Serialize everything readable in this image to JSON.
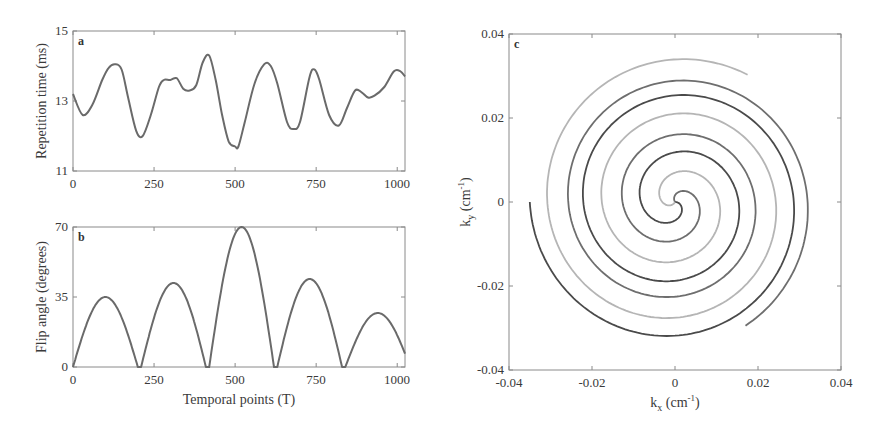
{
  "chart_data": [
    {
      "panel": "a",
      "type": "line",
      "title": "",
      "xlabel": "",
      "ylabel": "Repetition time (ms)",
      "xlim": [
        0,
        1024
      ],
      "ylim": [
        11,
        15
      ],
      "xticks": [
        0,
        250,
        500,
        750,
        1000
      ],
      "yticks": [
        11,
        13,
        15
      ],
      "grid": false,
      "series": [
        {
          "name": "TR",
          "x": [
            0,
            30,
            60,
            90,
            110,
            130,
            150,
            170,
            195,
            215,
            240,
            265,
            280,
            300,
            320,
            340,
            360,
            380,
            400,
            420,
            440,
            460,
            480,
            500,
            510,
            530,
            560,
            590,
            610,
            630,
            660,
            680,
            700,
            730,
            745,
            760,
            790,
            820,
            845,
            870,
            890,
            910,
            930,
            960,
            990,
            1010,
            1024
          ],
          "values": [
            13.2,
            12.6,
            12.9,
            13.6,
            13.95,
            14.05,
            13.9,
            13.1,
            12.15,
            12.0,
            12.6,
            13.4,
            13.6,
            13.6,
            13.65,
            13.35,
            13.3,
            13.45,
            14.1,
            14.3,
            13.6,
            12.6,
            11.85,
            11.7,
            11.7,
            12.4,
            13.5,
            14.05,
            14.0,
            13.5,
            12.4,
            12.2,
            12.4,
            13.7,
            13.9,
            13.6,
            12.6,
            12.3,
            12.8,
            13.3,
            13.25,
            13.1,
            13.15,
            13.4,
            13.85,
            13.85,
            13.7
          ]
        }
      ]
    },
    {
      "panel": "b",
      "type": "line",
      "title": "",
      "xlabel": "Temporal points (T)",
      "ylabel": "Flip angle (degrees)",
      "xlim": [
        0,
        1024
      ],
      "ylim": [
        0,
        70
      ],
      "xticks": [
        0,
        250,
        500,
        750,
        1000
      ],
      "yticks": [
        0,
        35,
        70
      ],
      "grid": false,
      "series": [
        {
          "name": "Flip angle",
          "lobes": [
            {
              "start": 0,
              "end": 200,
              "peak_x": 100,
              "peak": 35,
              "start_value": 6
            },
            {
              "start": 210,
              "end": 410,
              "peak_x": 310,
              "peak": 42
            },
            {
              "start": 420,
              "end": 620,
              "peak_x": 520,
              "peak": 70
            },
            {
              "start": 630,
              "end": 830,
              "peak_x": 730,
              "peak": 44
            },
            {
              "start": 840,
              "end": 1024,
              "peak_x": 940,
              "peak": 27,
              "end_value": 8
            }
          ]
        }
      ]
    },
    {
      "panel": "c",
      "type": "line",
      "title": "",
      "xlabel": "kx (cm-1)",
      "ylabel": "ky (cm-1)",
      "xlim": [
        -0.04,
        0.04
      ],
      "ylim": [
        -0.04,
        0.04
      ],
      "xticks": [
        -0.04,
        -0.02,
        0,
        0.02,
        0.04
      ],
      "yticks": [
        -0.04,
        -0.02,
        0,
        0.02,
        0.04
      ],
      "grid": false,
      "description": "Interleaved variable-density spiral k-space trajectory, max radius ~0.035 cm^-1",
      "series": [
        {
          "name": "arm-1",
          "shade": "#4a4a4a",
          "rotation_deg": 0,
          "k_max": 0.035,
          "turns": 2.5
        },
        {
          "name": "arm-2",
          "shade": "#6e6e6e",
          "rotation_deg": 120,
          "k_max": 0.034,
          "turns": 2.5
        },
        {
          "name": "arm-3",
          "shade": "#b5b5b5",
          "rotation_deg": 240,
          "k_max": 0.035,
          "turns": 2.5
        }
      ]
    }
  ],
  "panels": {
    "a": {
      "letter": "a",
      "ylabel": "Repetition time (ms)",
      "xticks": [
        "0",
        "250",
        "500",
        "750",
        "1000"
      ],
      "yticks": [
        "11",
        "13",
        "15"
      ]
    },
    "b": {
      "letter": "b",
      "ylabel": "Flip angle (degrees)",
      "xlabel": "Temporal points (T)",
      "xticks": [
        "0",
        "250",
        "500",
        "750",
        "1000"
      ],
      "yticks": [
        "0",
        "35",
        "70"
      ]
    },
    "c": {
      "letter": "c",
      "xlabel_main": "k",
      "xlabel_sub": "x",
      "xlabel_unit": " (cm",
      "xlabel_sup": "-1",
      "xlabel_close": ")",
      "ylabel_main": "k",
      "ylabel_sub": "y",
      "ylabel_unit": " (cm",
      "ylabel_sup": "-1",
      "ylabel_close": ")",
      "xticks": [
        "-0.04",
        "-0.02",
        "0",
        "0.02",
        "0.04"
      ],
      "yticks": [
        "0.04",
        "0.02",
        "0",
        "-0.02",
        "-0.04"
      ]
    }
  },
  "colors": {
    "frame": "#8a8a8a",
    "curve": "#6a6a6a",
    "text": "#3a3a3a"
  }
}
